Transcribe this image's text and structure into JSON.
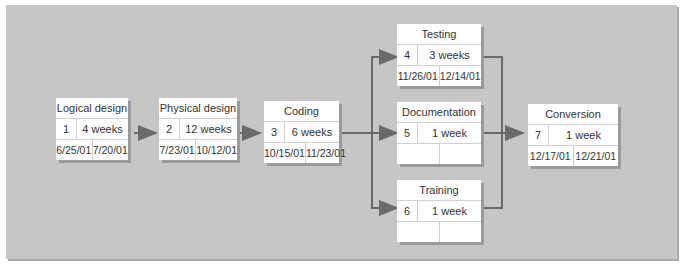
{
  "diagram": {
    "type": "network (PERT) diagram",
    "nodes": [
      {
        "id": 1,
        "name": "Logical design",
        "duration": "4 weeks",
        "start": "6/25/01",
        "end": "7/20/01"
      },
      {
        "id": 2,
        "name": "Physical design",
        "duration": "12 weeks",
        "start": "7/23/01",
        "end": "10/12/01"
      },
      {
        "id": 3,
        "name": "Coding",
        "duration": "6 weeks",
        "start": "10/15/01",
        "end": "11/23/01"
      },
      {
        "id": 4,
        "name": "Testing",
        "duration": "3 weeks",
        "start": "11/26/01",
        "end": "12/14/01"
      },
      {
        "id": 5,
        "name": "Documentation",
        "duration": "1 week",
        "start": "",
        "end": ""
      },
      {
        "id": 6,
        "name": "Training",
        "duration": "1 week",
        "start": "",
        "end": ""
      },
      {
        "id": 7,
        "name": "Conversion",
        "duration": "1 week",
        "start": "12/17/01",
        "end": "12/21/01"
      }
    ],
    "edges": [
      {
        "from": 1,
        "to": 2
      },
      {
        "from": 2,
        "to": 3
      },
      {
        "from": 3,
        "to": 4
      },
      {
        "from": 3,
        "to": 5
      },
      {
        "from": 3,
        "to": 6
      },
      {
        "from": 4,
        "to": 7
      },
      {
        "from": 5,
        "to": 7
      },
      {
        "from": 6,
        "to": 7
      }
    ],
    "colors": {
      "background": "#c6c6c6",
      "node": "#ffffff",
      "arrow": "#666666"
    }
  }
}
